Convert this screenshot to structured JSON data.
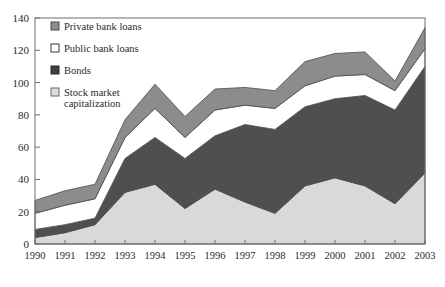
{
  "chart_data": {
    "type": "area",
    "stacked": true,
    "title": "",
    "subtitle": "",
    "xlabel": "",
    "ylabel": "",
    "x": [
      "1990",
      "1991",
      "1992",
      "1993",
      "1994",
      "1995",
      "1996",
      "1997",
      "1998",
      "1999",
      "2000",
      "2001",
      "2002",
      "2003"
    ],
    "categories": [
      "1990",
      "1991",
      "1992",
      "1993",
      "1994",
      "1995",
      "1996",
      "1997",
      "1998",
      "1999",
      "2000",
      "2001",
      "2002",
      "2003"
    ],
    "xlim": [
      1990,
      2003
    ],
    "ylim": [
      0,
      140
    ],
    "yticks": [
      0,
      20,
      40,
      60,
      80,
      100,
      120,
      140
    ],
    "xticks": [
      "1990",
      "1991",
      "1992",
      "1993",
      "1994",
      "1995",
      "1996",
      "1997",
      "1998",
      "1999",
      "2000",
      "2001",
      "2002",
      "2003"
    ],
    "grid": false,
    "legend_position": "top-left",
    "series": [
      {
        "name": "Stock market capitalization",
        "color": "#d9d9d9",
        "values": [
          4,
          7,
          12,
          32,
          37,
          22,
          34,
          26,
          19,
          36,
          41,
          36,
          25,
          44
        ]
      },
      {
        "name": "Bonds",
        "color": "#4f4f4f",
        "values": [
          5,
          5,
          4,
          21,
          29,
          31,
          33,
          48,
          52,
          49,
          49,
          56,
          58,
          66
        ]
      },
      {
        "name": "Public bank loans",
        "color": "#ffffff",
        "values": [
          10,
          12,
          12,
          13,
          18,
          13,
          16,
          12,
          13,
          13,
          14,
          13,
          12,
          11
        ]
      },
      {
        "name": "Private bank loans",
        "color": "#8c8c8c",
        "values": [
          8,
          9,
          9,
          11,
          15,
          13,
          13,
          11,
          11,
          15,
          14,
          14,
          6,
          13
        ]
      }
    ],
    "series_totals": [
      27,
      33,
      37,
      77,
      99,
      79,
      96,
      97,
      95,
      113,
      118,
      119,
      101,
      134
    ],
    "legend": [
      {
        "label": "Private bank loans",
        "swatch": "#8c8c8c",
        "border": "#4a4a4a"
      },
      {
        "label": "Public bank loans",
        "swatch": "#ffffff",
        "border": "#3a3a3a"
      },
      {
        "label": "Bonds",
        "swatch": "#3f3f3f",
        "border": "#2a2a2a"
      },
      {
        "label": "Stock market capitalization",
        "swatch": "#dcdcdc",
        "border": "#6a6a6a"
      }
    ],
    "legend_lines": [
      [
        "Private bank loans"
      ],
      [
        "Public bank loans"
      ],
      [
        "Bonds"
      ],
      [
        "Stock market",
        "capitalization"
      ]
    ],
    "axis_color": "#6e6e6e",
    "frame": true
  }
}
